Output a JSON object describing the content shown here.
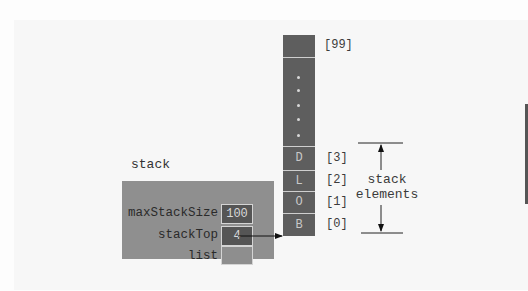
{
  "diagram": {
    "title": "stack",
    "struct": {
      "name": "stack",
      "fields": [
        {
          "label": "maxStackSize",
          "value": "100"
        },
        {
          "label": "stackTop",
          "value": "4"
        },
        {
          "label": "list",
          "value": ""
        }
      ]
    },
    "array": {
      "top_index": "[99]",
      "ellipsis_dots": 5,
      "cells": [
        {
          "value": "D",
          "index": "[3]"
        },
        {
          "value": "L",
          "index": "[2]"
        },
        {
          "value": "O",
          "index": "[1]"
        },
        {
          "value": "B",
          "index": "[0]"
        }
      ]
    },
    "bracket": {
      "label_line1": "stack",
      "label_line2": "elements"
    },
    "colors": {
      "struct_fill": "#8f8f8f",
      "array_fill": "#5e5e5e",
      "value_cell_fill": "#555555",
      "background": "#f7f7f7"
    }
  }
}
